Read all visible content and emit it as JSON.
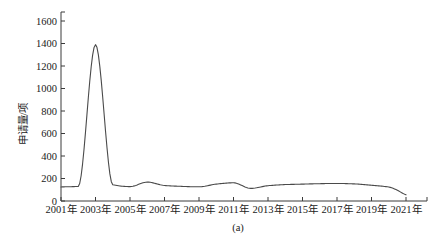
{
  "figure": {
    "caption": "(a)"
  },
  "chart_data": {
    "type": "line",
    "title": "",
    "xlabel": "",
    "ylabel": "申请量/项",
    "x": [
      2001,
      2002,
      2003,
      2004,
      2005,
      2006,
      2007,
      2008,
      2009,
      2010,
      2011,
      2012,
      2013,
      2014,
      2015,
      2016,
      2017,
      2018,
      2019,
      2020,
      2021
    ],
    "values": [
      125,
      130,
      1390,
      145,
      128,
      168,
      138,
      130,
      126,
      150,
      162,
      112,
      136,
      146,
      150,
      154,
      156,
      152,
      140,
      124,
      55
    ],
    "xlim": [
      2001,
      2022.2
    ],
    "ylim": [
      0,
      1600
    ],
    "xticks": [
      2001,
      2003,
      2005,
      2007,
      2009,
      2011,
      2013,
      2015,
      2017,
      2019,
      2021
    ],
    "x_tick_labels": [
      "2001年",
      "2003年",
      "2005年",
      "2007年",
      "2009年",
      "2011年",
      "2013年",
      "2015年",
      "2017年",
      "2019年",
      "2021年"
    ],
    "yticks": [
      0,
      200,
      400,
      600,
      800,
      1000,
      1200,
      1400,
      1600
    ],
    "y_tick_labels": [
      "0",
      "200",
      "400",
      "600",
      "800",
      "1000",
      "1200",
      "1400",
      "1600"
    ],
    "grid": false,
    "legend": "none",
    "line_color": "#4a4a4a",
    "axis_color": "#3a3a3a",
    "text_color": "#1a1a1a",
    "background_color": "#ffffff"
  }
}
